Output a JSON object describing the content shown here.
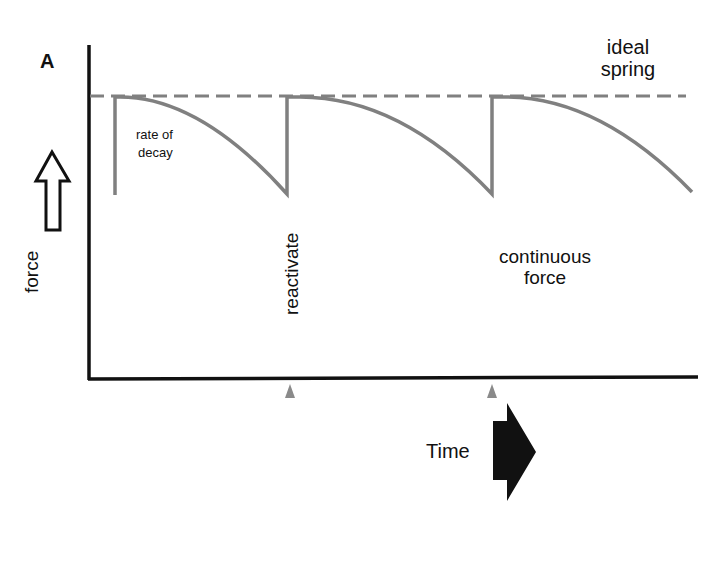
{
  "figure": {
    "panel_label": "A",
    "labels": {
      "ideal_spring_line1": "ideal",
      "ideal_spring_line2": "spring",
      "rate_of_decay_line1": "rate of",
      "rate_of_decay_line2": "decay",
      "y_axis": "force",
      "reactivate": "reactivate",
      "continuous_force_line1": "continuous",
      "continuous_force_line2": "force",
      "x_axis": "Time"
    },
    "colors": {
      "axis": "#111111",
      "curve": "#808080",
      "dashed": "#808080",
      "marker": "#8a8a8a"
    },
    "icons": {
      "force_arrow": "hollow-up-arrow",
      "time_arrow": "solid-right-arrow",
      "reactivation_markers": "small-up-triangle"
    }
  }
}
